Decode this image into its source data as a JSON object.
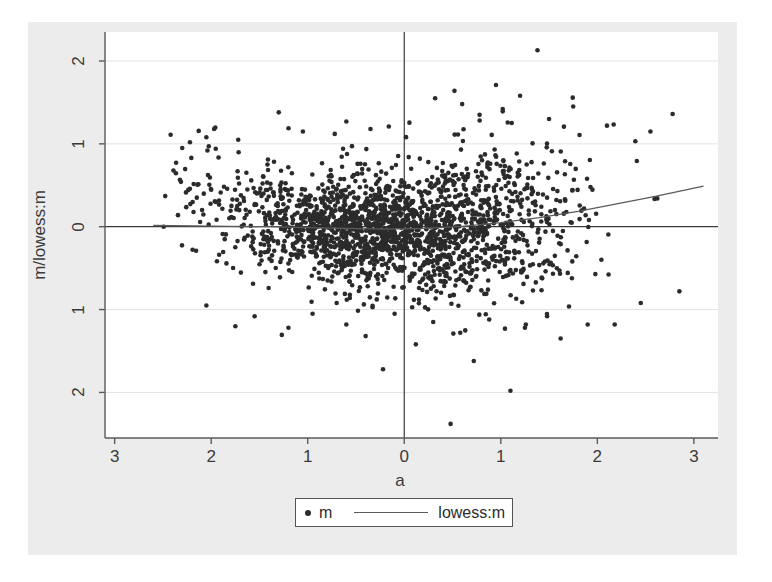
{
  "figure": {
    "background_color": "#ececec",
    "panel_color": "#ffffff",
    "page_color": "#ffffff"
  },
  "legend": {
    "scatter_label": "m",
    "smoother_label": "lowess:m",
    "marker_icon": "filled-circle-icon",
    "line_icon": "line-segment-icon"
  },
  "chart_data": {
    "type": "scatter",
    "title": "",
    "subtitle": "",
    "xlabel": "a",
    "ylabel": "m/lowess:m",
    "xlim": [
      -3.1,
      3.25
    ],
    "ylim": [
      -2.55,
      2.35
    ],
    "xticks": [
      -3,
      -2,
      -1,
      0,
      1,
      2,
      3
    ],
    "xticklabels": [
      "3",
      "2",
      "1",
      "0",
      "1",
      "2",
      "3"
    ],
    "yticks": [
      -2,
      -1,
      0,
      1,
      2
    ],
    "yticklabels": [
      "2",
      "1",
      "0",
      "1",
      "2"
    ],
    "grid": true,
    "grid_axis": "y",
    "legend_position": "below-axes-center",
    "marker_color": "#2b2b2b",
    "marker_size_px": 4.6,
    "reference_lines": [
      {
        "name": "zero-horizontal",
        "orientation": "horizontal",
        "value": 0,
        "color": "#3a3a3a"
      },
      {
        "name": "zero-vertical",
        "orientation": "vertical",
        "value": 0,
        "color": "#3a3a3a"
      }
    ],
    "series": [
      {
        "name": "m",
        "type": "scatter",
        "n_points": 2100,
        "description": "MA-plot style cloud: variance shrinks from left (a=-2.6) toward a=-0.5, broad dense core from a=-1 to a=1.2, then a moderate right tail out to a=3.1",
        "generator": {
          "x_min": -2.62,
          "x_max": 3.12,
          "x_mode": -0.15,
          "x_concentration": 2.4,
          "spread_profile": [
            {
              "a": -2.6,
              "sd": 0.48
            },
            {
              "a": -2.0,
              "sd": 0.4
            },
            {
              "a": -1.5,
              "sd": 0.36
            },
            {
              "a": -1.0,
              "sd": 0.33
            },
            {
              "a": -0.5,
              "sd": 0.33
            },
            {
              "a": 0.0,
              "sd": 0.36
            },
            {
              "a": 0.5,
              "sd": 0.42
            },
            {
              "a": 1.0,
              "sd": 0.48
            },
            {
              "a": 1.5,
              "sd": 0.54
            },
            {
              "a": 2.0,
              "sd": 0.52
            },
            {
              "a": 2.5,
              "sd": 0.46
            },
            {
              "a": 3.1,
              "sd": 0.4
            }
          ],
          "mean_profile": [
            {
              "a": -2.6,
              "m": 0.52
            },
            {
              "a": -2.2,
              "m": 0.34
            },
            {
              "a": -1.8,
              "m": 0.18
            },
            {
              "a": -1.4,
              "m": 0.07
            },
            {
              "a": -1.0,
              "m": 0.01
            },
            {
              "a": -0.6,
              "m": -0.03
            },
            {
              "a": -0.2,
              "m": -0.05
            },
            {
              "a": 0.2,
              "m": -0.04
            },
            {
              "a": 0.6,
              "m": -0.01
            },
            {
              "a": 1.0,
              "m": 0.03
            },
            {
              "a": 1.4,
              "m": 0.08
            },
            {
              "a": 1.8,
              "m": 0.15
            },
            {
              "a": 2.2,
              "m": 0.26
            },
            {
              "a": 2.6,
              "m": 0.36
            },
            {
              "a": 3.1,
              "m": 0.5
            }
          ],
          "outliers": [
            {
              "a": -2.42,
              "m": 1.11
            },
            {
              "a": -2.3,
              "m": 0.95
            },
            {
              "a": -2.22,
              "m": 1.02
            },
            {
              "a": -2.05,
              "m": 1.08
            },
            {
              "a": -1.97,
              "m": 1.18
            },
            {
              "a": -1.72,
              "m": 1.05
            },
            {
              "a": -1.3,
              "m": 1.38
            },
            {
              "a": -1.05,
              "m": 1.15
            },
            {
              "a": -0.72,
              "m": 1.12
            },
            {
              "a": -0.6,
              "m": 1.27
            },
            {
              "a": -0.35,
              "m": 1.18
            },
            {
              "a": -0.16,
              "m": 1.21
            },
            {
              "a": 0.32,
              "m": 1.55
            },
            {
              "a": 0.52,
              "m": 1.64
            },
            {
              "a": 0.6,
              "m": 1.48
            },
            {
              "a": 0.78,
              "m": 1.35
            },
            {
              "a": 0.95,
              "m": 1.71
            },
            {
              "a": 1.02,
              "m": 1.42
            },
            {
              "a": 1.2,
              "m": 1.58
            },
            {
              "a": 1.38,
              "m": 2.13
            },
            {
              "a": 1.5,
              "m": 1.3
            },
            {
              "a": 1.75,
              "m": 1.45
            },
            {
              "a": 2.1,
              "m": 1.22
            },
            {
              "a": 2.55,
              "m": 1.15
            },
            {
              "a": 2.78,
              "m": 1.36
            },
            {
              "a": -2.05,
              "m": -0.95
            },
            {
              "a": -1.55,
              "m": -1.08
            },
            {
              "a": -1.2,
              "m": -1.22
            },
            {
              "a": -0.95,
              "m": -1.05
            },
            {
              "a": -0.6,
              "m": -1.18
            },
            {
              "a": -0.4,
              "m": -1.32
            },
            {
              "a": -0.22,
              "m": -1.72
            },
            {
              "a": -0.1,
              "m": -1.05
            },
            {
              "a": 0.12,
              "m": -1.42
            },
            {
              "a": 0.3,
              "m": -1.15
            },
            {
              "a": 0.48,
              "m": -2.38
            },
            {
              "a": 0.58,
              "m": -1.28
            },
            {
              "a": 0.72,
              "m": -1.62
            },
            {
              "a": 0.88,
              "m": -1.12
            },
            {
              "a": 1.1,
              "m": -1.98
            },
            {
              "a": 1.25,
              "m": -1.22
            },
            {
              "a": 1.48,
              "m": -1.08
            },
            {
              "a": 1.62,
              "m": -1.35
            },
            {
              "a": 1.9,
              "m": -1.18
            },
            {
              "a": 2.18,
              "m": -1.18
            },
            {
              "a": 2.45,
              "m": -0.92
            },
            {
              "a": 2.85,
              "m": -0.78
            }
          ]
        }
      },
      {
        "name": "lowess:m",
        "type": "line",
        "color": "#5a5a5a",
        "points": [
          {
            "a": -2.6,
            "m": 0.015
          },
          {
            "a": -2.2,
            "m": 0.01
          },
          {
            "a": -1.8,
            "m": 0.005
          },
          {
            "a": -1.4,
            "m": 0.0
          },
          {
            "a": -1.0,
            "m": -0.01
          },
          {
            "a": -0.6,
            "m": -0.02
          },
          {
            "a": -0.2,
            "m": -0.03
          },
          {
            "a": 0.2,
            "m": -0.02
          },
          {
            "a": 0.6,
            "m": 0.005
          },
          {
            "a": 1.0,
            "m": 0.05
          },
          {
            "a": 1.4,
            "m": 0.11
          },
          {
            "a": 1.8,
            "m": 0.185
          },
          {
            "a": 2.2,
            "m": 0.275
          },
          {
            "a": 2.6,
            "m": 0.365
          },
          {
            "a": 3.1,
            "m": 0.49
          }
        ]
      }
    ]
  }
}
